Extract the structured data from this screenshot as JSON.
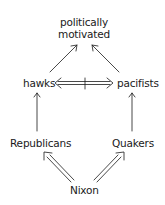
{
  "diagram": {
    "type": "inheritance-network",
    "nodes": {
      "top": {
        "line1": "politically",
        "line2": "motivated"
      },
      "hawks": "hawks",
      "pacifists": "pacifists",
      "republicans": "Republicans",
      "quakers": "Quakers",
      "nixon": "Nixon"
    },
    "edges": [
      {
        "from": "hawks",
        "to": "politically motivated",
        "style": "single-arrow"
      },
      {
        "from": "pacifists",
        "to": "politically motivated",
        "style": "single-arrow"
      },
      {
        "from": "hawks",
        "to": "pacifists",
        "style": "double-line-bidirectional-negated"
      },
      {
        "from": "Republicans",
        "to": "hawks",
        "style": "single-arrow"
      },
      {
        "from": "Quakers",
        "to": "pacifists",
        "style": "single-arrow"
      },
      {
        "from": "Nixon",
        "to": "Republicans",
        "style": "double-line-arrow"
      },
      {
        "from": "Nixon",
        "to": "Quakers",
        "style": "double-line-arrow"
      }
    ],
    "colors": {
      "ink": "#1a1a1a",
      "background": "#ffffff"
    }
  }
}
